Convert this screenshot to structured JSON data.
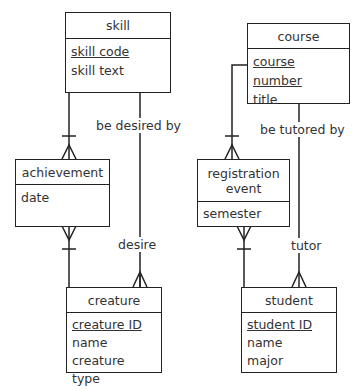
{
  "diagrams": {
    "left": {
      "entities": {
        "skill": {
          "name": "skill",
          "attributes": [
            {
              "text": "skill code",
              "pk": true
            },
            {
              "text": "skill text",
              "pk": false
            }
          ]
        },
        "achievement": {
          "name": "achievement",
          "attributes": [
            {
              "text": "date",
              "pk": false
            }
          ]
        },
        "creature": {
          "name": "creature",
          "attributes": [
            {
              "text": "creature ID",
              "pk": true
            },
            {
              "text": "name",
              "pk": false
            },
            {
              "text": "creature type",
              "pk": false
            }
          ]
        }
      },
      "relationships": {
        "be_desired_by": "be desired by",
        "desire": "desire"
      }
    },
    "right": {
      "entities": {
        "course": {
          "name": "course",
          "attributes": [
            {
              "text": "course number",
              "pk": true
            },
            {
              "text": "title",
              "pk": false
            }
          ]
        },
        "registration_event": {
          "name": "registration event",
          "attributes": [
            {
              "text": "semester",
              "pk": false
            }
          ]
        },
        "student": {
          "name": "student",
          "attributes": [
            {
              "text": "student ID",
              "pk": true
            },
            {
              "text": "name",
              "pk": false
            },
            {
              "text": "major",
              "pk": false
            }
          ]
        }
      },
      "relationships": {
        "be_tutored_by": "be tutored by",
        "tutor": "tutor"
      }
    }
  },
  "colors": {
    "line": "#222222",
    "text": "#333333",
    "background": "#ffffff"
  }
}
